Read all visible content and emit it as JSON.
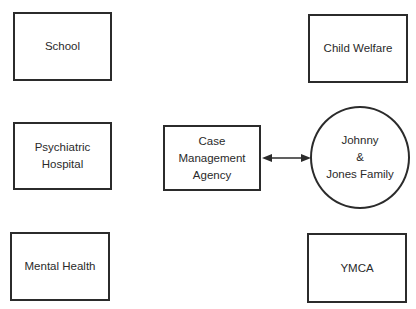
{
  "diagram": {
    "nodes": [
      {
        "id": "school",
        "label": "School",
        "shape": "rect"
      },
      {
        "id": "psychiatric-hospital",
        "label": "Psychiatric\nHospital",
        "shape": "rect"
      },
      {
        "id": "mental-health",
        "label": "Mental Health",
        "shape": "rect"
      },
      {
        "id": "case-management-agency",
        "label": "Case\nManagement\nAgency",
        "shape": "rect"
      },
      {
        "id": "johnny-jones-family",
        "label": "Johnny\n&\nJones Family",
        "shape": "circle"
      },
      {
        "id": "child-welfare",
        "label": "Child Welfare",
        "shape": "rect"
      },
      {
        "id": "ymca",
        "label": "YMCA",
        "shape": "rect"
      }
    ],
    "edges": [
      {
        "from": "case-management-agency",
        "to": "johnny-jones-family",
        "direction": "bidirectional"
      }
    ],
    "colors": {
      "stroke": "#2b2b2b",
      "text": "#2a2a2a",
      "background": "#ffffff"
    }
  }
}
